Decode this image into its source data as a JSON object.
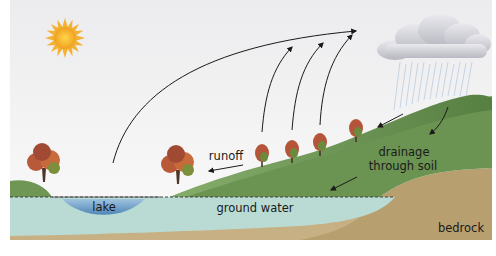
{
  "diagram": {
    "labels": {
      "lake": "lake",
      "ground_water": "ground water",
      "bedrock": "bedrock",
      "runoff": "runoff",
      "drainage_line1": "drainage",
      "drainage_line2": "through soil"
    },
    "elements": {
      "sun": "sun-icon",
      "cloud": "rain-cloud-icon",
      "trees": 6,
      "evaporation_arrows": 4
    },
    "colors": {
      "sky": "#f3f3f3",
      "hill_dark": "#5f8a4a",
      "hill_light": "#7ea763",
      "ground_water": "#b7d8d2",
      "lake": "#6fa2c8",
      "bedrock": "#c9b489",
      "bedrock_dark": "#b49c6c",
      "sun": "#f5b52e",
      "cloud": "#d6d6dc",
      "rain": "#9cb8d8",
      "arrow": "#1a1a1a",
      "tree_canopy": "#c0623a",
      "tree_canopy_green": "#6a8d3e",
      "trunk": "#4a3526"
    }
  }
}
